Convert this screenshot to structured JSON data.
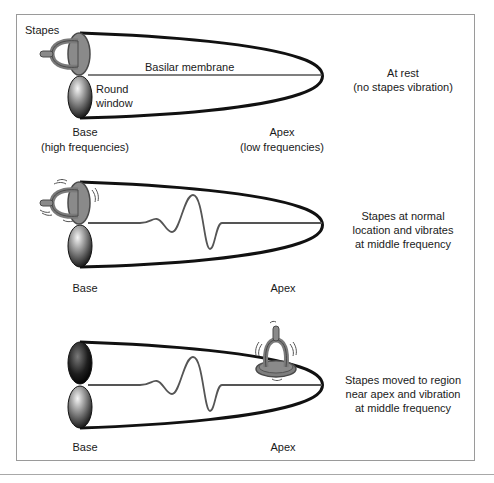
{
  "figure": {
    "colors": {
      "outline": "#111111",
      "membrane": "#555555",
      "stapes_fill": "#8a8a8a",
      "stapes_stroke": "#4a4a4a",
      "frame": "#9a9a9a"
    }
  },
  "panels": [
    {
      "id": "rest",
      "labels": {
        "stapes": "Stapes",
        "membrane": "Basilar membrane",
        "round_window_line1": "Round",
        "round_window_line2": "window",
        "base_line1": "Base",
        "base_line2": "(high frequencies)",
        "apex_line1": "Apex",
        "apex_line2": "(low frequencies)"
      },
      "description": [
        "At rest",
        "(no stapes vibration)"
      ]
    },
    {
      "id": "normal",
      "labels": {
        "base": "Base",
        "apex": "Apex"
      },
      "description": [
        "Stapes at normal",
        "location and vibrates",
        "at middle frequency"
      ]
    },
    {
      "id": "moved",
      "labels": {
        "base": "Base",
        "apex": "Apex"
      },
      "description": [
        "Stapes moved to region",
        "near apex and vibration",
        "at middle frequency"
      ]
    }
  ]
}
